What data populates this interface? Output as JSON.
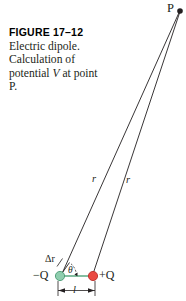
{
  "figure": {
    "title": "FIGURE 17–12",
    "caption_lines": [
      "Electric dipole.",
      "Calculation of",
      "potential V at",
      "point P."
    ],
    "caption_part_1": "Electric dipole. Calculation of potential ",
    "caption_italic": "V",
    "caption_part_2": " at point P.",
    "background_color": "#ffffff",
    "line_color": "#231f20"
  },
  "diagram": {
    "type": "physics-vector-diagram",
    "labels": {
      "point_p": "P",
      "distance_r_left": "r",
      "distance_r_right": "r",
      "delta_r": "Δr",
      "negative_charge": "−Q",
      "positive_charge": "+Q",
      "angle_theta": "θ",
      "separation": "l"
    },
    "charges": [
      {
        "name": "negative-charge",
        "label": "−Q",
        "color": "#7ec6a8",
        "stroke": "#3f8f6c",
        "x": 60,
        "y": 276,
        "r": 4.6
      },
      {
        "name": "positive-charge",
        "label": "+Q",
        "color": "#e8413c",
        "stroke": "#b02a27",
        "x": 93,
        "y": 276,
        "r": 4.6
      }
    ],
    "point_p_coords": {
      "x": 180,
      "y": 11
    },
    "dipole_axis_color": "#3f8f6c",
    "separation_tick_left_x": 58,
    "separation_tick_right_x": 95,
    "separation_baseline_y": 291
  }
}
